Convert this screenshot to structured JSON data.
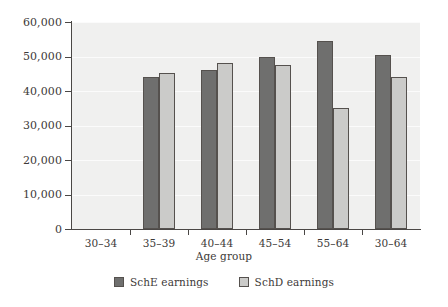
{
  "chart_data": {
    "type": "bar",
    "title": "",
    "xlabel": "Age group",
    "ylabel": "",
    "categories": [
      "30–34",
      "35–39",
      "40–44",
      "45–54",
      "55–64",
      "30–64"
    ],
    "series": [
      {
        "name": "SchE earnings",
        "color": "#6f6f6e",
        "values": [
          null,
          44200,
          46000,
          50000,
          54400,
          50500
        ]
      },
      {
        "name": "SchD earnings",
        "color": "#cbcbc9",
        "values": [
          null,
          45300,
          48200,
          47500,
          35000,
          44000
        ]
      }
    ],
    "ylim": [
      0,
      60000
    ],
    "ytick_values": [
      0,
      10000,
      20000,
      30000,
      40000,
      50000,
      60000
    ],
    "ytick_labels": [
      "0",
      "10,000",
      "20,000",
      "30,000",
      "40,000",
      "50,000",
      "60,000"
    ],
    "grid": true,
    "legend_position": "bottom",
    "plot_background": "#f0f0ef",
    "axis_color": "#4a4745"
  }
}
